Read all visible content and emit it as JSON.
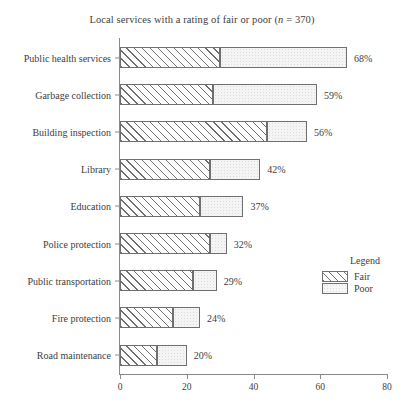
{
  "chart_data": {
    "type": "bar",
    "orientation": "horizontal",
    "stacked": true,
    "title": "Local services with a rating of fair or poor (n = 370)",
    "title_plain": "Local services with a rating of fair or poor (",
    "title_italic_n": "n",
    "title_tail": " = 370)",
    "sample_size": 370,
    "xlabel": "",
    "ylabel": "",
    "xlim": [
      0,
      80
    ],
    "xticks": [
      0,
      20,
      40,
      60,
      80
    ],
    "xtick_labels": [
      "0",
      "20",
      "40",
      "60",
      "80"
    ],
    "grid": false,
    "legend_position": "right",
    "categories": [
      "Public health services",
      "Garbage collection",
      "Building inspection",
      "Library",
      "Education",
      "Police protection",
      "Public transportation",
      "Fire protection",
      "Road maintenance"
    ],
    "series": [
      {
        "name": "Fair",
        "values": [
          30,
          28,
          44,
          27,
          24,
          27,
          22,
          16,
          11
        ]
      },
      {
        "name": "Poor",
        "values": [
          38,
          31,
          12,
          15,
          13,
          5,
          7,
          8,
          9
        ]
      }
    ],
    "totals": [
      68,
      59,
      56,
      42,
      37,
      32,
      29,
      24,
      20
    ],
    "total_labels": [
      "68%",
      "59%",
      "56%",
      "42%",
      "37%",
      "32%",
      "29%",
      "24%",
      "20%"
    ]
  },
  "legend": {
    "title": "Legend",
    "entries": [
      {
        "label": "Fair",
        "pattern": "diagonal-hatch"
      },
      {
        "label": "Poor",
        "pattern": "light-dotted"
      }
    ]
  },
  "colors": {
    "axis": "#8a8a8a",
    "outline": "#6f6f6f",
    "text": "#3d3d3d",
    "background": "#ffffff",
    "fair_fill": "#fdfdfd",
    "poor_fill": "#f4f4f4"
  }
}
